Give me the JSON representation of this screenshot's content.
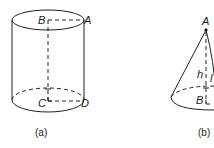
{
  "figures": [
    {
      "id": "a",
      "shape": "cylinder",
      "caption": "(a)",
      "labels": {
        "top_center": "B",
        "top_right": "A",
        "bottom_center": "C",
        "bottom_right": "D"
      }
    },
    {
      "id": "b",
      "shape": "cone",
      "caption": "(b)",
      "labels": {
        "apex": "A",
        "height": "h",
        "slant": "l",
        "base_center": "B"
      }
    }
  ],
  "colors": {
    "stroke": "#222222",
    "background": "#ffffff"
  }
}
